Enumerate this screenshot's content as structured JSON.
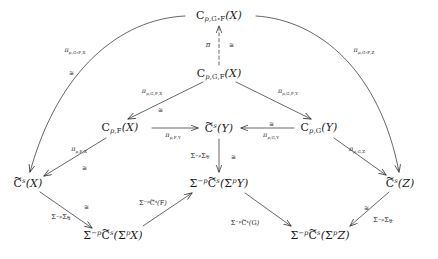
{
  "diagram": {
    "type": "commutative-diagram",
    "stroke_color": "#2b2b2b",
    "text_color": "#1a1a1a",
    "iso_symbol": "≅",
    "nodes": [
      {
        "id": "n_top",
        "label": "C_{p,G∘F}(X)",
        "x": 219,
        "y": 16,
        "tex": "C_{p,G\\circ F}(X)"
      },
      {
        "id": "n_cgfx",
        "label": "C_{p,G,F}(X)",
        "x": 219,
        "y": 74,
        "tex": "C_{p,G,F}(X)"
      },
      {
        "id": "n_cpfx",
        "label": "C_{p,F}(X)",
        "x": 120,
        "y": 128,
        "tex": "C_{p,F}(X)"
      },
      {
        "id": "n_csy",
        "label": "C̃^s(Y)",
        "x": 219,
        "y": 128,
        "tex": "\\widetilde{C}^s(Y)"
      },
      {
        "id": "n_cpgy",
        "label": "C_{p,G}(Y)",
        "x": 319,
        "y": 128,
        "tex": "C_{p,G}(Y)"
      },
      {
        "id": "n_csx",
        "label": "C̃^s(X)",
        "x": 28,
        "y": 183,
        "tex": "\\widetilde{C}^s(X)"
      },
      {
        "id": "n_sigy",
        "label": "Σ^{-p}C̃^s(Σ^pY)",
        "x": 219,
        "y": 183,
        "tex": "\\Sigma^{-p}\\widetilde{C}^s(\\Sigma^pY)"
      },
      {
        "id": "n_csz",
        "label": "C̃^s(Z)",
        "x": 400,
        "y": 183,
        "tex": "\\widetilde{C}^s(Z)"
      },
      {
        "id": "n_sigx",
        "label": "Σ^{-p}C̃^s(Σ^pX)",
        "x": 113,
        "y": 235,
        "tex": "\\Sigma^{-p}\\widetilde{C}^s(\\Sigma^pX)"
      },
      {
        "id": "n_sigz",
        "label": "Σ^{-p}C̃^s(Σ^pZ)",
        "x": 320,
        "y": 235,
        "tex": "\\Sigma^{-p}\\widetilde{C}^s(\\Sigma^pZ)"
      }
    ],
    "edge_labels": [
      {
        "id": "e_pi",
        "text": "π",
        "x": 208,
        "y": 45,
        "tex": "\\pi"
      },
      {
        "id": "e_pgfx_outer",
        "text": "π_{p,G∘F,X}",
        "x": 75,
        "y": 51,
        "tex": "\\pi_{p,G\\circ F,X}"
      },
      {
        "id": "e_pgfz_outer",
        "text": "π_{p,G∘F,Z}",
        "x": 364,
        "y": 51,
        "tex": "\\pi_{p,G\\circ F,Z}"
      },
      {
        "id": "e_pgfx",
        "text": "π_{p,G,F,X}",
        "x": 152,
        "y": 92,
        "tex": "\\pi_{p,G,F,X}"
      },
      {
        "id": "e_pgfy",
        "text": "π_{p,G,F,Y}",
        "x": 288,
        "y": 92,
        "tex": "\\pi_{p,G,F,Y}"
      },
      {
        "id": "e_pfy",
        "text": "π_{p,F,Y}",
        "x": 173,
        "y": 136,
        "tex": "\\pi_{p,F,Y}"
      },
      {
        "id": "e_pgy",
        "text": "π_{p,G,Y}",
        "x": 271,
        "y": 136,
        "tex": "\\pi_{p,G,Y}"
      },
      {
        "id": "e_pfx",
        "text": "π_{p,F,X}",
        "x": 79,
        "y": 150,
        "tex": "\\pi_{p,F,X}"
      },
      {
        "id": "e_pgz",
        "text": "π_{p,G,Z}",
        "x": 357,
        "y": 150,
        "tex": "\\pi_{p,G,Z}"
      },
      {
        "id": "e_sigyp",
        "text": "Σ^{-p}Σ^p_Y",
        "x": 200,
        "y": 157,
        "tex": "\\Sigma^{-p}\\Sigma^p_Y"
      },
      {
        "id": "e_sigxp",
        "text": "Σ^{-p}Σ^p_X",
        "x": 61,
        "y": 218,
        "tex": "\\Sigma^{-p}\\Sigma^p_X"
      },
      {
        "id": "e_sigzp",
        "text": "Σ^{-p}Σ^p_Z",
        "x": 383,
        "y": 221,
        "tex": "\\Sigma^{-p}\\Sigma^p_Z"
      },
      {
        "id": "e_csf",
        "text": "Σ^{-p}C̃^s(F)",
        "x": 153,
        "y": 203,
        "tex": "\\Sigma^{-p}\\widetilde{C}^s(F)"
      },
      {
        "id": "e_csg",
        "text": "Σ^{-p}C̃^s(G)",
        "x": 245,
        "y": 223,
        "tex": "\\Sigma^{-p}\\widetilde{C}^s(G)"
      }
    ],
    "iso_marks": [
      {
        "id": "i_pi",
        "x": 231,
        "y": 45
      },
      {
        "id": "i_outer_l",
        "x": 71,
        "y": 73
      },
      {
        "id": "i_gfx",
        "x": 160,
        "y": 110
      },
      {
        "id": "i_pgy",
        "x": 271,
        "y": 124
      },
      {
        "id": "i_pfx",
        "x": 84,
        "y": 168
      },
      {
        "id": "i_sigy",
        "x": 233,
        "y": 157
      },
      {
        "id": "i_sigx",
        "x": 86,
        "y": 207
      },
      {
        "id": "i_sigz",
        "x": 366,
        "y": 208
      }
    ]
  }
}
